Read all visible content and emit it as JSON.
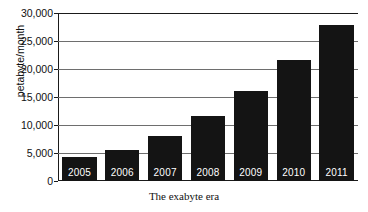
{
  "chart_data": {
    "type": "bar",
    "title": "",
    "xlabel": "The exabyte era",
    "ylabel": "petabyte/month",
    "categories": [
      "2005",
      "2006",
      "2007",
      "2008",
      "2009",
      "2010",
      "2011"
    ],
    "values": [
      4300,
      5500,
      8000,
      11600,
      16100,
      21600,
      27900
    ],
    "ylim": [
      0,
      30000
    ],
    "ytick_labels": [
      "0",
      "5,000",
      "10,000",
      "15,000",
      "20,000",
      "25,000",
      "30,000"
    ],
    "ytick_values": [
      0,
      5000,
      10000,
      15000,
      20000,
      25000,
      30000
    ],
    "grid": true,
    "legend": "none",
    "bar_color": "#141414",
    "bar_label_color": "#ffffff",
    "axis_color": "#1a1a1a",
    "gridline_color": "#6e6e6e",
    "background": "#ffffff",
    "bar_labels_inside": [
      "2005",
      "2006",
      "2007",
      "2008",
      "2009",
      "2010",
      "2011"
    ]
  }
}
